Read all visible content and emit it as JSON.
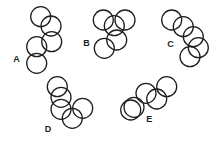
{
  "diagram": {
    "radius": 10,
    "stroke_color": "#1e1e1e",
    "groups": [
      {
        "label": "A",
        "label_pos": [
          16.5,
          62
        ],
        "circles": [
          [
            40.7,
            16.7
          ],
          [
            51,
            26
          ],
          [
            51.7,
            41.7
          ],
          [
            36.7,
            46.7
          ],
          [
            36.7,
            63.3
          ]
        ]
      },
      {
        "label": "B",
        "label_pos": [
          86.5,
          45.5
        ],
        "circles": [
          [
            103.3,
            20
          ],
          [
            125,
            20
          ],
          [
            114.3,
            25.7
          ],
          [
            116.7,
            40
          ],
          [
            104.3,
            48.3
          ]
        ]
      },
      {
        "label": "C",
        "label_pos": [
          170.5,
          46.5
        ],
        "circles": [
          [
            171.7,
            20
          ],
          [
            183.3,
            26.7
          ],
          [
            193.3,
            36.7
          ],
          [
            198.3,
            47.7
          ],
          [
            190,
            56.7
          ]
        ]
      },
      {
        "label": "D",
        "label_pos": [
          48,
          131.5
        ],
        "circles": [
          [
            57.3,
            86.7
          ],
          [
            61,
            97.3
          ],
          [
            61,
            109.3
          ],
          [
            72.3,
            118.3
          ],
          [
            82.7,
            108.3
          ]
        ]
      },
      {
        "label": "E",
        "label_pos": [
          149.3,
          121.5
        ],
        "circles": [
          [
            130.7,
            110
          ],
          [
            134,
            107.3
          ],
          [
            146,
            93.3
          ],
          [
            156.7,
            99
          ],
          [
            166.7,
            86.7
          ]
        ]
      }
    ]
  }
}
